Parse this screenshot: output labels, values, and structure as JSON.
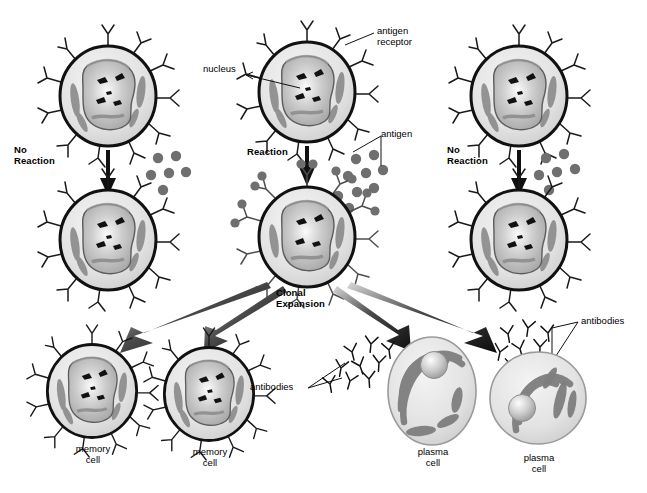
{
  "figure": {
    "title_present": false,
    "background_color": "#ffffff"
  },
  "palette": {
    "outline": "#1a1a1a",
    "cytoplasm_light": "#e8e8e8",
    "cytoplasm_mid": "#d2d2d2",
    "nucleus_fill": "#b9b9b9",
    "nucleus_highlight": "#f2f2f2",
    "organelle_gray": "#8a8a8a",
    "antigen_gray": "#6f6f6f",
    "arrow_black": "#111111",
    "text": "#000000"
  },
  "labels": {
    "no_reaction_left": "No\nReaction",
    "reaction_center": "Reaction",
    "no_reaction_right": "No\nReaction",
    "nucleus": "nucleus",
    "antigen_receptor": "antigen\nreceptor",
    "antigen": "antigen",
    "clonal_expansion": "Clonal\nExpansion",
    "memory_cell_1": "memory\ncell",
    "memory_cell_2": "memory\ncell",
    "plasma_cell_1": "plasma\ncell",
    "plasma_cell_2": "plasma\ncell",
    "antibodies_left": "antibodies",
    "antibodies_right": "antibodies"
  },
  "columns": [
    {
      "name": "left-column",
      "outcome": "No Reaction",
      "top_cell": "naive-b-cell",
      "bottom_cell": "naive-b-cell",
      "antigen_count": 6,
      "antigen_bound": false
    },
    {
      "name": "center-column",
      "outcome": "Reaction",
      "top_cell": "naive-b-cell",
      "bottom_cell": "activated-b-cell",
      "antigen_count": 9,
      "antigen_bound": true
    },
    {
      "name": "right-column",
      "outcome": "No Reaction",
      "top_cell": "naive-b-cell",
      "bottom_cell": "naive-b-cell",
      "antigen_count": 6,
      "antigen_bound": false
    }
  ],
  "progeny": [
    {
      "name": "memory-cell",
      "label": "memory\ncell",
      "has_receptors": true,
      "secretes_antibodies": false
    },
    {
      "name": "memory-cell",
      "label": "memory\ncell",
      "has_receptors": true,
      "secretes_antibodies": false
    },
    {
      "name": "plasma-cell",
      "label": "plasma\ncell",
      "has_receptors": false,
      "secretes_antibodies": true
    },
    {
      "name": "plasma-cell",
      "label": "plasma\ncell",
      "has_receptors": false,
      "secretes_antibodies": true
    }
  ],
  "arrows": {
    "vertical_count": 3,
    "fan_count": 4,
    "fan_targets": [
      "memory-cell-1",
      "memory-cell-2",
      "plasma-cell-1",
      "plasma-cell-2"
    ]
  }
}
